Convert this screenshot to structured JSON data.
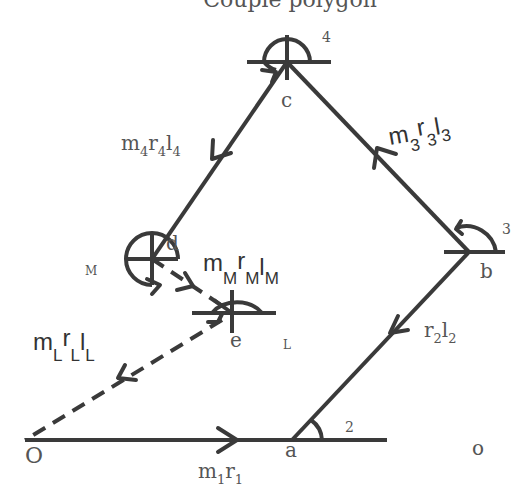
{
  "title": "Couple polygon",
  "points": {
    "O": "O",
    "a": "a",
    "b": "b",
    "c": "c",
    "d": "d",
    "e": "e",
    "o": "o"
  },
  "angle_labels": {
    "a": "2",
    "b": "3",
    "c": "4",
    "d": "M",
    "e": "L"
  },
  "vectors": [
    {
      "id": "O-a",
      "label_main": "m",
      "label_sub1": "1",
      "label_mid": "r",
      "label_sub2": "1",
      "label_last": "",
      "label_sub3": "",
      "style": "solid"
    },
    {
      "id": "a-b",
      "label_main": "r",
      "label_sub1": "2",
      "label_mid": "l",
      "label_sub2": "2",
      "style": "solid"
    },
    {
      "id": "b-c",
      "label_main": "m",
      "label_sub1": "3",
      "label_mid": "r",
      "label_sub2": "3",
      "label_last": "l",
      "label_sub3": "3",
      "style": "solid"
    },
    {
      "id": "c-d",
      "label_main": "m",
      "label_sub1": "4",
      "label_mid": "r",
      "label_sub2": "4",
      "label_last": "l",
      "label_sub3": "4",
      "style": "solid"
    },
    {
      "id": "d-e",
      "label_main": "m",
      "label_sub1": "M",
      "label_mid": "r",
      "label_sub2": "M",
      "label_last": "l",
      "label_sub3": "M",
      "style": "dashed"
    },
    {
      "id": "e-O",
      "label_main": "m",
      "label_sub1": "L",
      "label_mid": "r",
      "label_sub2": "L",
      "label_last": "l",
      "label_sub3": "L",
      "style": "dashed"
    }
  ]
}
